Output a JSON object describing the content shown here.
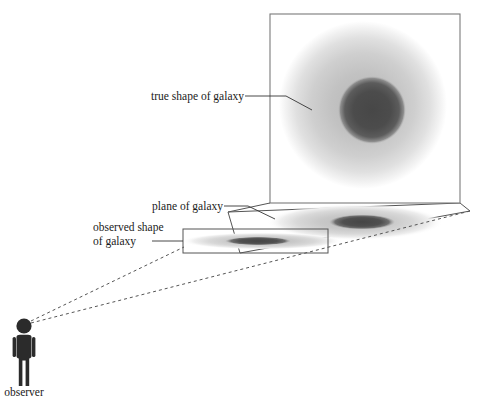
{
  "diagram": {
    "labels": {
      "true_shape": "true shape of galaxy",
      "plane_of_galaxy": "plane of galaxy",
      "observed_shape_line1": "observed shape",
      "observed_shape_line2": "of galaxy",
      "observer": "observer"
    },
    "colors": {
      "background": "#ffffff",
      "galaxy_halo_outer": "#e8e8e8",
      "galaxy_halo_mid": "#c8c8c8",
      "galaxy_core": "#4a4a4a",
      "observer_silhouette": "#2b2b2b",
      "frame_stroke": "#7a7a7a",
      "plane_stroke": "#555555",
      "sight_line_stroke": "#555555",
      "leader_stroke": "#333333",
      "text": "#1a1a1a"
    },
    "elements": {
      "face_on_frame": {
        "name": "face-on-galaxy-frame",
        "top_left_x": 270,
        "top_left_y": 14,
        "width": 190,
        "height": 189
      },
      "face_on_galaxy": {
        "name": "face-on-galaxy-image",
        "center_x": 365,
        "center_y": 105,
        "halo_radius": 80,
        "core_radius": 32,
        "core_offset_x": 8,
        "core_offset_y": 5
      },
      "projected_galaxy": {
        "name": "projected-galaxy-in-plane",
        "center_x": 355,
        "center_y": 222,
        "halo_rx": 85,
        "halo_ry": 17,
        "core_rx": 32,
        "core_ry": 7
      },
      "observed_galaxy": {
        "name": "observed-galaxy-flattened",
        "center_x": 262,
        "center_y": 241,
        "halo_rx": 78,
        "halo_ry": 8,
        "core_rx": 32,
        "core_ry": 4
      },
      "observed_box": {
        "name": "observed-shape-box",
        "x": 183,
        "y": 229,
        "width": 145,
        "height": 24
      },
      "observer_figure": {
        "name": "observer-figure",
        "head_center_x": 24,
        "head_center_y": 326,
        "head_radius": 7.5,
        "body_top_y": 336,
        "body_bottom_y": 386
      },
      "sight_lines": [
        {
          "name": "sight-line-upper",
          "x1": 31,
          "y1": 321,
          "x2": 183,
          "y2": 246
        },
        {
          "name": "sight-line-lower",
          "x1": 31,
          "y1": 323,
          "x2": 470,
          "y2": 211
        }
      ]
    }
  }
}
